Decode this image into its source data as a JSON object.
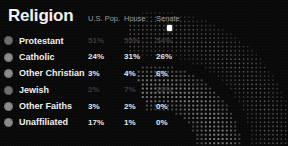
{
  "panel": {
    "title": "Religion",
    "columns": [
      "U.S. Pop.",
      "House",
      "Senate"
    ],
    "cursor_icon": "pointer-marker-icon",
    "accent_color": "#ffffff",
    "background_color": "#090909",
    "text_color": "#f0f0f0",
    "muted_text_color": "#3a3a3a",
    "bullet_color": "#8d8d8d"
  },
  "rows": [
    {
      "bullet": "legend-dot-icon",
      "label": "Protestant",
      "us_pop": "51%",
      "house": "55%",
      "senate": "54%",
      "dim": true
    },
    {
      "bullet": "legend-dot-icon",
      "label": "Catholic",
      "us_pop": "24%",
      "house": "31%",
      "senate": "26%",
      "dim": false
    },
    {
      "bullet": "legend-dot-icon",
      "label": "Other Christian",
      "us_pop": "3%",
      "house": "4%",
      "senate": "6%",
      "dim": false
    },
    {
      "bullet": "legend-dot-icon",
      "label": "Jewish",
      "us_pop": "2%",
      "house": "7%",
      "senate": "13%",
      "dim": true
    },
    {
      "bullet": "legend-dot-icon",
      "label": "Other Faiths",
      "us_pop": "3%",
      "house": "2%",
      "senate": "0%",
      "dim": false
    },
    {
      "bullet": "legend-dot-icon",
      "label": "Unaffiliated",
      "us_pop": "17%",
      "house": "1%",
      "senate": "0%",
      "dim": false
    }
  ],
  "chart_data": {
    "type": "table",
    "title": "Religion",
    "columns": [
      "Religion",
      "U.S. Pop.",
      "House",
      "Senate"
    ],
    "categories": [
      "Protestant",
      "Catholic",
      "Other Christian",
      "Jewish",
      "Other Faiths",
      "Unaffiliated"
    ],
    "series": [
      {
        "name": "U.S. Pop.",
        "values": [
          51,
          24,
          3,
          2,
          3,
          17
        ]
      },
      {
        "name": "House",
        "values": [
          55,
          31,
          4,
          7,
          2,
          1
        ]
      },
      {
        "name": "Senate",
        "values": [
          54,
          26,
          6,
          13,
          0,
          0
        ]
      }
    ],
    "units": "percent",
    "ylim": [
      0,
      100
    ],
    "grid": false,
    "legend": "left-column"
  },
  "artwork": {
    "name": "radial-dot-matrix",
    "rings": [
      {
        "name": "outer-arc",
        "dot_color": "#5a5a5a",
        "dot_size": 1.6,
        "r_inner": 96,
        "r_outer": 140
      },
      {
        "name": "inner-arc",
        "dot_color": "#7e7e7e",
        "dot_size": 2.0,
        "r_inner": 42,
        "r_outer": 86
      }
    ],
    "center_x": 28,
    "center_y": 158
  }
}
